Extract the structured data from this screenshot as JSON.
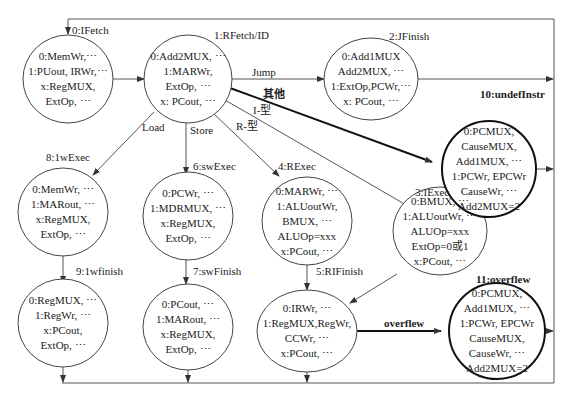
{
  "diagram": {
    "type": "state-machine",
    "states": [
      {
        "id": "ifetch",
        "name": "0:IFetch",
        "lines": [
          "0:MemWr,⋯",
          "1:PUout, IRWr,⋯",
          "x:RegMUX,",
          "ExtOp, ⋯"
        ]
      },
      {
        "id": "rfetch",
        "name": "1:RFetch/ID",
        "lines": [
          "0:Add2MUX, ⋯",
          "1:MARWr,",
          "ExtOp, ⋯",
          "x: PCout, ⋯"
        ]
      },
      {
        "id": "jfinish",
        "name": "2:JFinish",
        "lines": [
          "0:Add1MUX",
          "Add2MUX, ⋯",
          "1:ExtOp,PCWr,⋯",
          "x: PCout, ⋯"
        ]
      },
      {
        "id": "undefinstr",
        "name": "10:undefInstr",
        "lines": [
          "0:PCMUX,",
          "CauseMUX,",
          "Add1MUX, ⋯",
          "1:PCWr, EPCWr",
          "CauseWr, ⋯",
          "Add2MUX=2"
        ]
      },
      {
        "id": "lwexec",
        "name": "8:1wExec",
        "lines": [
          "0:MemWr, ⋯",
          "1:MARout, ⋯",
          "x:RegMUX,",
          "ExtOp, ⋯"
        ]
      },
      {
        "id": "swexec",
        "name": "6:swExec",
        "lines": [
          "0:PCWr, ⋯",
          "1:MDRMUX, ⋯",
          "x:RegMUX,",
          "ExtOp, ⋯"
        ]
      },
      {
        "id": "rexec",
        "name": "4:RExec",
        "lines": [
          "0:MARWr, ⋯",
          "1:ALUoutWr,",
          "BMUX, ⋯",
          "ALUOp=xxx",
          "x:PCout, ⋯"
        ]
      },
      {
        "id": "iexec",
        "name": "3:IExec",
        "lines": [
          "0:BMUX, ⋯",
          "1:ALUoutWr, ⋯",
          "ALUOp=xxx",
          "ExtOp=0或1",
          "x:PCout, ⋯"
        ]
      },
      {
        "id": "lwfinish",
        "name": "9:1wfinish",
        "lines": [
          "0:RegMUX, ⋯",
          "1:RegWr, ⋯",
          "x:PCout,",
          "ExtOp, ⋯"
        ]
      },
      {
        "id": "swfinish",
        "name": "7:swFinish",
        "lines": [
          "0:PCout, ⋯",
          "1:MARout, ⋯",
          "x:RegMUX,",
          "ExtOp, ⋯"
        ]
      },
      {
        "id": "rifinish",
        "name": "5:RIFinish",
        "lines": [
          "0:IRWr, ⋯",
          "1:RegMUX,RegWr,",
          "CCWr, ⋯",
          "x:PCout, ⋯"
        ]
      },
      {
        "id": "overflew",
        "name": "11:overflew",
        "lines": [
          "0:PCMUX,",
          "Add1MUX, ⋯",
          "1:PCWr, EPCWr",
          "CauseMUX,",
          "CauseWr, ⋯",
          "Add2MUX=2"
        ]
      }
    ],
    "edges": [
      {
        "from": "ifetch",
        "to": "rfetch",
        "label": ""
      },
      {
        "from": "rfetch",
        "to": "jfinish",
        "label": "Jump"
      },
      {
        "from": "rfetch",
        "to": "undefinstr",
        "label": "其他"
      },
      {
        "from": "rfetch",
        "to": "iexec",
        "label": "I-型"
      },
      {
        "from": "rfetch",
        "to": "rexec",
        "label": "R-型"
      },
      {
        "from": "rfetch",
        "to": "swexec",
        "label": "Store"
      },
      {
        "from": "rfetch",
        "to": "lwexec",
        "label": "Load"
      },
      {
        "from": "lwexec",
        "to": "lwfinish",
        "label": ""
      },
      {
        "from": "swexec",
        "to": "swfinish",
        "label": ""
      },
      {
        "from": "rexec",
        "to": "rifinish",
        "label": ""
      },
      {
        "from": "iexec",
        "to": "rifinish",
        "label": ""
      },
      {
        "from": "rifinish",
        "to": "overflew",
        "label": "overflew"
      },
      {
        "from": "jfinish",
        "to": "ifetch",
        "label": ""
      },
      {
        "from": "undefinstr",
        "to": "ifetch",
        "label": ""
      },
      {
        "from": "overflew",
        "to": "ifetch",
        "label": ""
      },
      {
        "from": "lwfinish",
        "to": "ifetch",
        "label": ""
      },
      {
        "from": "swfinish",
        "to": "ifetch",
        "label": ""
      },
      {
        "from": "rifinish",
        "to": "ifetch",
        "label": ""
      }
    ]
  }
}
